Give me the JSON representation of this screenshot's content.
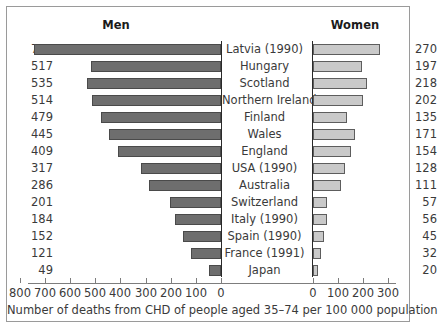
{
  "header": {
    "men_label": "Men",
    "women_label": "Women"
  },
  "caption": "Number of deaths from CHD of people aged 35–74 per 100 000 population",
  "axis": {
    "left_ticks": [
      "800",
      "700",
      "600",
      "500",
      "400",
      "300",
      "200",
      "100",
      "0"
    ],
    "right_ticks": [
      "0",
      "100",
      "200",
      "300"
    ],
    "left_max": 800,
    "right_max": 330
  },
  "colors": {
    "men_bar": "#6e6e6e",
    "men_border": "#4a4a4a",
    "women_bar": "#c9c9c9",
    "women_border": "#5d5d5d",
    "frame": "#9a9a9a",
    "text": "#3a3a3a"
  },
  "chart_data": {
    "type": "bar",
    "title": "",
    "subtitle": "",
    "xlabel": "Number of deaths from CHD of people aged 35–74 per 100 000 population",
    "ylabel": "",
    "orientation": "horizontal",
    "style": "back-to-back population pyramid",
    "categories": [
      "Latvia (1990)",
      "Hungary",
      "Scotland",
      "Northern Ireland",
      "Finland",
      "Wales",
      "England",
      "USA (1990)",
      "Australia",
      "Switzerland",
      "Italy (1990)",
      "Spain (1990)",
      "France (1991)",
      "Japan"
    ],
    "series": [
      {
        "name": "Men",
        "side": "left",
        "axis_max": 800,
        "values": [
          744,
          517,
          535,
          514,
          479,
          445,
          409,
          317,
          286,
          201,
          184,
          152,
          121,
          49
        ]
      },
      {
        "name": "Women",
        "side": "right",
        "axis_max": 330,
        "values": [
          270,
          197,
          218,
          202,
          135,
          171,
          154,
          128,
          111,
          57,
          56,
          45,
          32,
          20
        ]
      }
    ],
    "legend": [
      "Men",
      "Women"
    ],
    "legend_position": "top",
    "grid": false
  },
  "rows": [
    {
      "country": "Latvia (1990)",
      "men": 744,
      "women": 270
    },
    {
      "country": "Hungary",
      "men": 517,
      "women": 197
    },
    {
      "country": "Scotland",
      "men": 535,
      "women": 218
    },
    {
      "country": "Northern Ireland",
      "men": 514,
      "women": 202
    },
    {
      "country": "Finland",
      "men": 479,
      "women": 135
    },
    {
      "country": "Wales",
      "men": 445,
      "women": 171
    },
    {
      "country": "England",
      "men": 409,
      "women": 154
    },
    {
      "country": "USA (1990)",
      "men": 317,
      "women": 128
    },
    {
      "country": "Australia",
      "men": 286,
      "women": 111
    },
    {
      "country": "Switzerland",
      "men": 201,
      "women": 57
    },
    {
      "country": "Italy (1990)",
      "men": 184,
      "women": 56
    },
    {
      "country": "Spain (1990)",
      "men": 152,
      "women": 45
    },
    {
      "country": "France (1991)",
      "men": 121,
      "women": 32
    },
    {
      "country": "Japan",
      "men": 49,
      "women": 20
    }
  ]
}
